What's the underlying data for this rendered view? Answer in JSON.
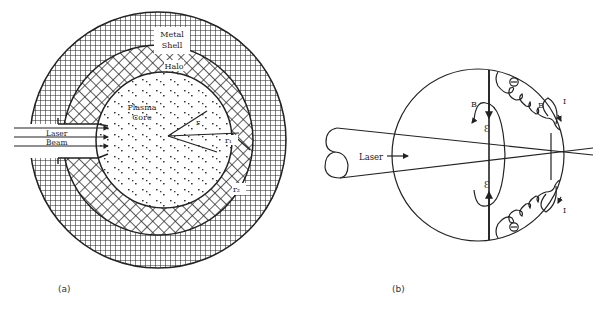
{
  "panel_a": {
    "caption": "(a)",
    "labels": {
      "metal_shell_line1": "Metal",
      "metal_shell_line2": "Shell",
      "halo": "Halo",
      "plasma_line1": "Plasma",
      "plasma_line2": "Core",
      "laser_line1": "Laser",
      "laser_line2": "Beam",
      "r": "r",
      "r1": "r₁",
      "r2": "r₂"
    }
  },
  "panel_b": {
    "caption": "(b)",
    "labels": {
      "laser": "Laser",
      "B_left": "B",
      "B_right": "B",
      "E_top": "Ɛ",
      "E_bottom": "Ɛ",
      "I_top": "I",
      "I_bottom": "I",
      "electron_top": "⊖",
      "electron_bottom": "⊖"
    }
  }
}
